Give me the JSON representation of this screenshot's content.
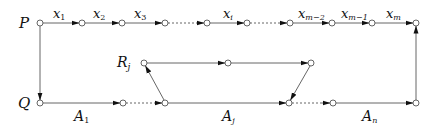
{
  "diagram": {
    "vertices": {
      "P": {
        "label": "P"
      },
      "Q": {
        "label": "Q"
      },
      "R": {
        "label": "R",
        "sub": "j"
      }
    },
    "top_edges": [
      {
        "label": "x",
        "sub": "1"
      },
      {
        "label": "x",
        "sub": "2"
      },
      {
        "label": "x",
        "sub": "3"
      },
      {
        "label": "x",
        "sub": "i"
      },
      {
        "label": "x",
        "sub": "m−2"
      },
      {
        "label": "x",
        "sub": "m−1"
      },
      {
        "label": "x",
        "sub": "m"
      }
    ],
    "bottom_edges": [
      {
        "label": "A",
        "sub": "1"
      },
      {
        "label": "A",
        "sub": "j"
      },
      {
        "label": "A",
        "sub": "n"
      }
    ],
    "colors": {
      "line": "#555555",
      "arrow": "#111111",
      "node_fill": "#ffffff"
    }
  }
}
